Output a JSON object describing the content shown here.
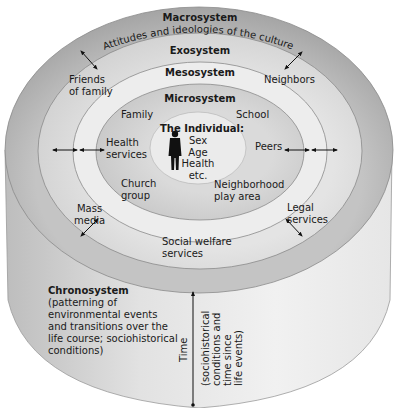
{
  "diagram": {
    "colors": {
      "macrosystem": "#a9a9a9",
      "exosystem": "#d6d6d6",
      "mesosystem": "#ececec",
      "microsystem": "#cdcdcd",
      "individual": "#e8e8e8",
      "cylinder_side": "#e4e4e4",
      "outline": "#8a8a8a",
      "text": "#1a1a1a"
    },
    "layers": {
      "macrosystem": {
        "title": "Macrosystem",
        "subtitle": "Attitudes and ideologies of the culture"
      },
      "exosystem": {
        "title": "Exosystem",
        "items": [
          "Friends of family",
          "Neighbors",
          "Mass media",
          "Legal services",
          "Social welfare services"
        ]
      },
      "mesosystem": {
        "title": "Mesosystem"
      },
      "microsystem": {
        "title": "Microsystem",
        "items": [
          "Family",
          "School",
          "Health services",
          "Peers",
          "Church group",
          "Neighborhood play area"
        ]
      },
      "individual": {
        "title": "The Individual:",
        "attributes": [
          "Sex",
          "Age",
          "Health",
          "etc."
        ]
      },
      "chronosystem": {
        "title": "Chronosystem",
        "description_lines": [
          "(patterning of",
          "environmental events",
          "and transitions over the",
          "life course; sociohistorical",
          "conditions)"
        ]
      }
    },
    "labels": {
      "friends_line1": "Friends",
      "friends_line2": "of family",
      "neighbors": "Neighbors",
      "family": "Family",
      "school": "School",
      "health_line1": "Health",
      "health_line2": "services",
      "peers": "Peers",
      "church_line1": "Church",
      "church_line2": "group",
      "neighborhood_line1": "Neighborhood",
      "neighborhood_line2": "play area",
      "mass_line1": "Mass",
      "mass_line2": "media",
      "legal_line1": "Legal",
      "legal_line2": "services",
      "welfare_line1": "Social welfare",
      "welfare_line2": "services",
      "sex": "Sex",
      "age": "Age",
      "health": "Health",
      "etc": "etc."
    },
    "time_axis": {
      "label": "Time",
      "sub_lines": [
        "(sociohistorical",
        "conditions and",
        "time since",
        "life events)"
      ]
    }
  }
}
